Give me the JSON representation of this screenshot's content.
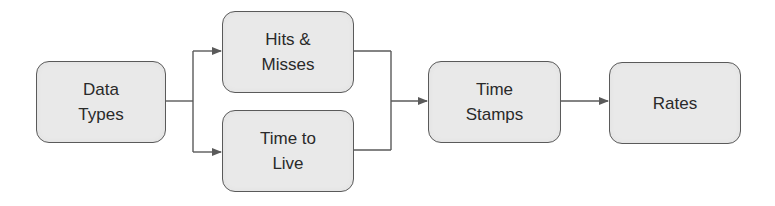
{
  "diagram": {
    "type": "flowchart",
    "colors": {
      "node_fill": "#e9e9e9",
      "node_border": "#5a5a5a",
      "line": "#5a5a5a",
      "text": "#2a2a2a"
    },
    "nodes": [
      {
        "id": "data_types",
        "label": "Data\nTypes"
      },
      {
        "id": "hits_misses",
        "label": "Hits &\nMisses"
      },
      {
        "id": "time_to_live",
        "label": "Time to\nLive"
      },
      {
        "id": "time_stamps",
        "label": "Time\nStamps"
      },
      {
        "id": "rates",
        "label": "Rates"
      }
    ],
    "edges": [
      {
        "from": "data_types",
        "to": "hits_misses"
      },
      {
        "from": "data_types",
        "to": "time_to_live"
      },
      {
        "from": "hits_misses",
        "to": "time_stamps"
      },
      {
        "from": "time_to_live",
        "to": "time_stamps"
      },
      {
        "from": "time_stamps",
        "to": "rates"
      }
    ]
  }
}
